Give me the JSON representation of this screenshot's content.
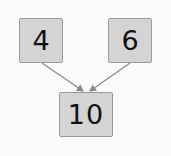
{
  "diagram": {
    "nodes": [
      {
        "id": "left",
        "label": "4"
      },
      {
        "id": "right",
        "label": "6"
      },
      {
        "id": "sum",
        "label": "10"
      }
    ],
    "edges": [
      {
        "from": "left",
        "to": "sum"
      },
      {
        "from": "right",
        "to": "sum"
      }
    ],
    "colors": {
      "box_fill": "#d4d4d4",
      "box_border": "#9a9a9a",
      "arrow": "#8a8a8a",
      "background": "#fbfbfb"
    }
  }
}
